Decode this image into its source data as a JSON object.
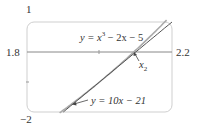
{
  "chart_data": {
    "type": "line",
    "title": "",
    "xlabel": "",
    "ylabel": "",
    "xlim": [
      1.8,
      2.2
    ],
    "ylim": [
      -2,
      1
    ],
    "grid": false,
    "axis_labels": {
      "x_min": "1.8",
      "x_max": "2.2",
      "y_max": "1",
      "y_min": "−2"
    },
    "series": [
      {
        "name": "y = x³ − 2x − 5",
        "label_parts": {
          "pre": "y = x",
          "sup": "3",
          "post": " − 2x − 5"
        },
        "x": [
          1.8,
          1.9,
          2.0,
          2.05,
          2.1,
          2.15,
          2.2
        ],
        "values": [
          -2.768,
          -1.941,
          -1.0,
          -0.485,
          0.061,
          0.639,
          1.248
        ]
      },
      {
        "name": "y = 10x − 21",
        "label_parts": {
          "pre": "y = 10x − 21"
        },
        "x": [
          1.8,
          2.2
        ],
        "values": [
          -3.0,
          1.0
        ]
      }
    ],
    "annotations": [
      {
        "text": "x",
        "sub": "2",
        "target_x": 2.1,
        "target_y": 0.0,
        "note": "root approximation x₂ (tangent intercept)"
      }
    ]
  }
}
